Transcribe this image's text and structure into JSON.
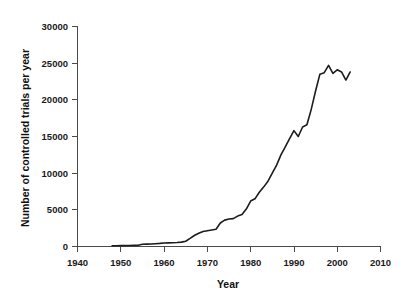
{
  "chart_data": {
    "type": "line",
    "title": "",
    "xlabel": "Year",
    "ylabel": "Number of controlled trials per year",
    "xlim": [
      1940,
      2010
    ],
    "ylim": [
      0,
      30000
    ],
    "grid": false,
    "legend": null,
    "legend_position": "none",
    "line_color": "#1c1c1c",
    "axis_color": "#4a4a4a",
    "background": "#ffffff",
    "xticks": [
      1940,
      1950,
      1960,
      1970,
      1980,
      1990,
      2000,
      2010
    ],
    "xtick_labels": [
      "1940",
      "1950",
      "1960",
      "1970",
      "1980",
      "1990",
      "2000",
      "2010"
    ],
    "yticks": [
      0,
      5000,
      10000,
      15000,
      20000,
      25000,
      30000
    ],
    "ytick_labels": [
      "0",
      "5000",
      "10000",
      "15000",
      "20000",
      "25000",
      "30000"
    ],
    "series": [
      {
        "name": "Controlled trials per year",
        "x": [
          1948,
          1949,
          1950,
          1951,
          1952,
          1953,
          1954,
          1955,
          1956,
          1957,
          1958,
          1959,
          1960,
          1961,
          1962,
          1963,
          1964,
          1965,
          1966,
          1967,
          1968,
          1969,
          1970,
          1971,
          1972,
          1973,
          1974,
          1975,
          1976,
          1977,
          1978,
          1979,
          1980,
          1981,
          1982,
          1983,
          1984,
          1985,
          1986,
          1987,
          1988,
          1989,
          1990,
          1991,
          1992,
          1993,
          1994,
          1995,
          1996,
          1997,
          1998,
          1999,
          2000,
          2001,
          2002,
          2003
        ],
        "values": [
          100,
          110,
          120,
          130,
          140,
          160,
          180,
          300,
          330,
          350,
          380,
          420,
          480,
          500,
          520,
          540,
          600,
          720,
          1100,
          1500,
          1800,
          2050,
          2150,
          2250,
          2350,
          3200,
          3600,
          3750,
          3800,
          4150,
          4350,
          5100,
          6200,
          6500,
          7400,
          8100,
          8900,
          10000,
          11100,
          12500,
          13600,
          14700,
          15800,
          15000,
          16300,
          16600,
          18700,
          21200,
          23500,
          23700,
          24700,
          23600,
          24100,
          23800,
          22700,
          23800
        ]
      }
    ],
    "annotations": []
  }
}
